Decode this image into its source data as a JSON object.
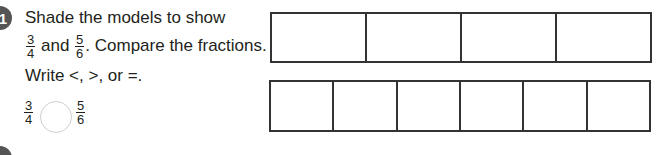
{
  "problem": {
    "number": "1",
    "line1": "Shade the models to show",
    "line2_prefix_fraction": {
      "num": "3",
      "den": "4"
    },
    "line2_and": "and",
    "line2_second_fraction": {
      "num": "5",
      "den": "6"
    },
    "line2_suffix": ". Compare the fractions.",
    "line3": "Write <, >, or =.",
    "compare_left": {
      "num": "3",
      "den": "4"
    },
    "compare_right": {
      "num": "5",
      "den": "6"
    },
    "answer_value": ""
  },
  "models": [
    {
      "label": "fourths-model",
      "parts": 4
    },
    {
      "label": "sixths-model",
      "parts": 6
    }
  ]
}
